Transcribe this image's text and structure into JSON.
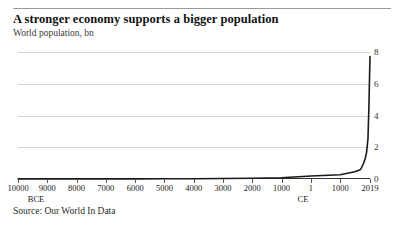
{
  "chart_data": {
    "type": "line",
    "title": "A stronger economy supports a bigger population",
    "subtitle": "World population, bn",
    "source": "Source: Our World In Data",
    "ylabel": "",
    "xlabel": "",
    "ylim": [
      0,
      8
    ],
    "yticks": [
      0,
      2,
      4,
      6,
      8
    ],
    "ytick_labels": [
      "0",
      "2",
      "4",
      "6",
      "8"
    ],
    "y_axis_position": "right",
    "grid": true,
    "legend": "none",
    "xtick_labels": [
      "10000",
      "9000",
      "8000",
      "7000",
      "6000",
      "5000",
      "4000",
      "3000",
      "2000",
      "1000",
      "1",
      "1000",
      "2019"
    ],
    "era_labels": [
      {
        "text": "BCE",
        "at_tick": "10000"
      },
      {
        "text": "CE",
        "at_tick": "1"
      }
    ],
    "x_note": "years; 10000 BCE on the left through 2019 CE on the right",
    "series": [
      {
        "name": "World population",
        "units": "bn",
        "x": [
          "10000 BCE",
          "9000 BCE",
          "8000 BCE",
          "7000 BCE",
          "6000 BCE",
          "5000 BCE",
          "4000 BCE",
          "3000 BCE",
          "2000 BCE",
          "1000 BCE",
          "1 CE",
          "1000 CE",
          "1500 CE",
          "1700 CE",
          "1800 CE",
          "1850 CE",
          "1900 CE",
          "1950 CE",
          "1980 CE",
          "2000 CE",
          "2019 CE"
        ],
        "values": [
          0.004,
          0.005,
          0.005,
          0.007,
          0.01,
          0.015,
          0.02,
          0.03,
          0.05,
          0.08,
          0.19,
          0.27,
          0.46,
          0.6,
          0.99,
          1.26,
          1.65,
          2.54,
          4.44,
          6.14,
          7.71
        ]
      }
    ],
    "annotations": []
  },
  "colors": {
    "line": "#1a1a1a",
    "grid": "#d6d6d6",
    "axis": "#333333",
    "rule": "#9a9a9a",
    "text": "#1a1a1a"
  }
}
